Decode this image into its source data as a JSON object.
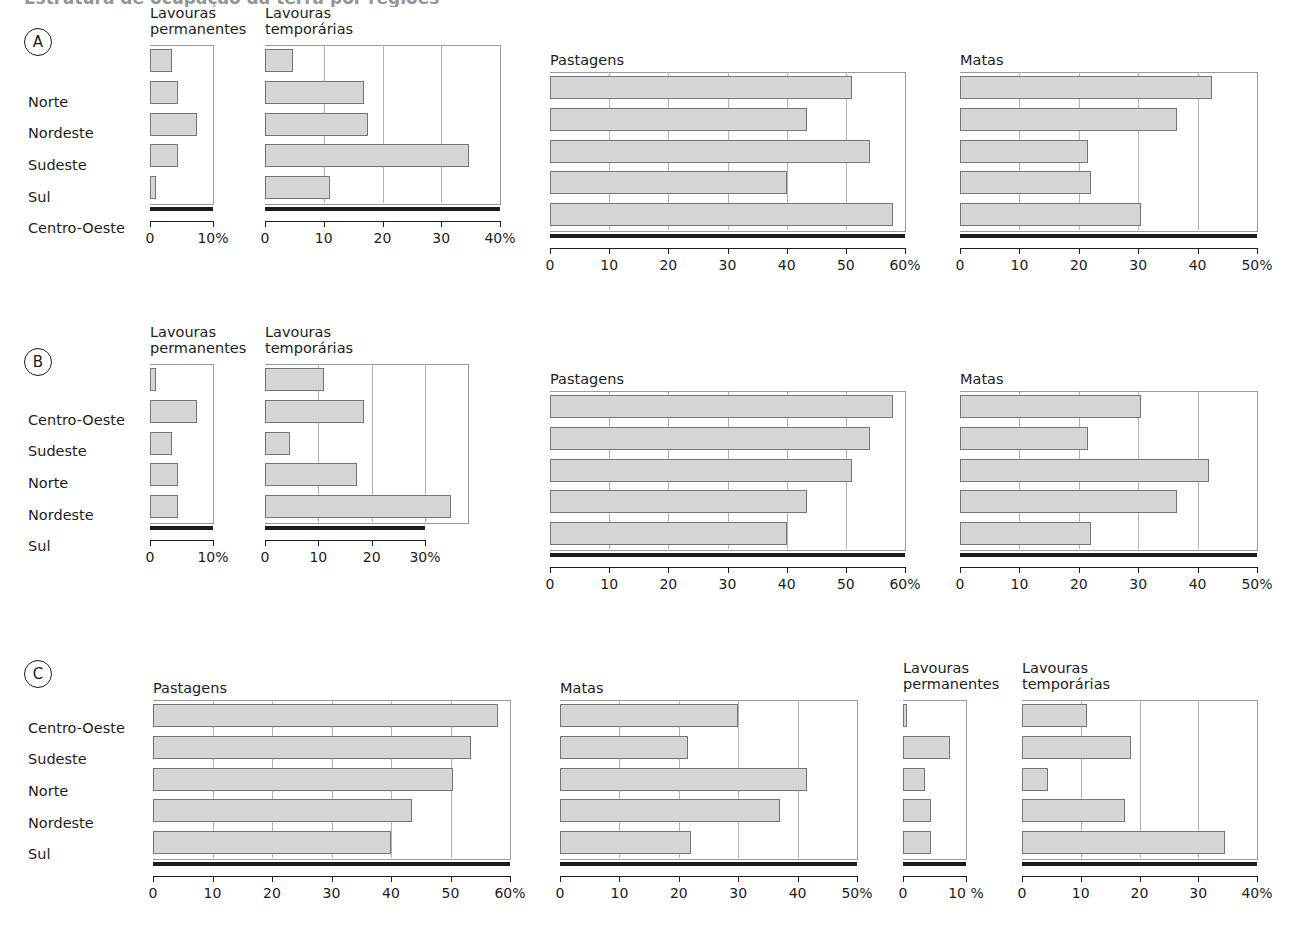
{
  "figure": {
    "cut_title": "Estrutura de ocupação da terra por regiões",
    "group_labels": [
      "A",
      "B",
      "C"
    ],
    "chart_titles": {
      "permanentes": "Lavouras\npermanentes",
      "temporarias": "Lavouras\ntemporárias",
      "pastagens": "Pastagens",
      "matas": "Matas"
    },
    "colors": {
      "bar_fill": "#d6d6d6",
      "bar_stroke": "#757575",
      "axis": "#1c1c1c",
      "grid": "#b4b4b4",
      "frame": "#9a9a9a"
    }
  },
  "chart_data": [
    {
      "id": "A-permanentes",
      "panel": "A",
      "type": "bar",
      "orientation": "horizontal",
      "title": "Lavouras permanentes",
      "categories": [
        "Norte",
        "Nordeste",
        "Sudeste",
        "Sul",
        "Centro-Oeste"
      ],
      "values": [
        3.5,
        4.5,
        7.5,
        4.5,
        1.0
      ],
      "xlabel": "",
      "ylabel": "",
      "xlim": [
        0,
        10
      ],
      "ticks": [
        0,
        10
      ],
      "ticklabels": [
        "0",
        "10%"
      ],
      "grid": false
    },
    {
      "id": "A-temporarias",
      "panel": "A",
      "type": "bar",
      "orientation": "horizontal",
      "title": "Lavouras temporárias",
      "categories": [
        "Norte",
        "Nordeste",
        "Sudeste",
        "Sul",
        "Centro-Oeste"
      ],
      "values": [
        4.7,
        16.8,
        17.6,
        34.8,
        11.0
      ],
      "xlim": [
        0,
        40
      ],
      "ticks": [
        0,
        10,
        20,
        30,
        40
      ],
      "ticklabels": [
        "0",
        "10",
        "20",
        "30",
        "40%"
      ],
      "grid": true
    },
    {
      "id": "A-pastagens",
      "panel": "A",
      "type": "bar",
      "orientation": "horizontal",
      "title": "Pastagens",
      "categories": [
        "Norte",
        "Nordeste",
        "Sudeste",
        "Sul",
        "Centro-Oeste"
      ],
      "values": [
        51.0,
        43.5,
        54.0,
        40.0,
        58.0
      ],
      "xlim": [
        0,
        60
      ],
      "ticks": [
        0,
        10,
        20,
        30,
        40,
        50,
        60
      ],
      "ticklabels": [
        "0",
        "10",
        "20",
        "30",
        "40",
        "50",
        "60%"
      ],
      "grid": true
    },
    {
      "id": "A-matas",
      "panel": "A",
      "type": "bar",
      "orientation": "horizontal",
      "title": "Matas",
      "categories": [
        "Norte",
        "Nordeste",
        "Sudeste",
        "Sul",
        "Centro-Oeste"
      ],
      "values": [
        42.5,
        36.5,
        21.5,
        22.0,
        30.5
      ],
      "xlim": [
        0,
        50
      ],
      "ticks": [
        0,
        10,
        20,
        30,
        40,
        50
      ],
      "ticklabels": [
        "0",
        "10",
        "20",
        "30",
        "40",
        "50%"
      ],
      "grid": true
    },
    {
      "id": "B-permanentes",
      "panel": "B",
      "type": "bar",
      "orientation": "horizontal",
      "title": "Lavouras permanentes",
      "categories": [
        "Centro-Oeste",
        "Sudeste",
        "Norte",
        "Nordeste",
        "Sul"
      ],
      "values": [
        1.0,
        7.5,
        3.5,
        4.5,
        4.5
      ],
      "xlim": [
        0,
        10
      ],
      "ticks": [
        0,
        10
      ],
      "ticklabels": [
        "0",
        "10%"
      ],
      "grid": false
    },
    {
      "id": "B-temporarias",
      "panel": "B",
      "type": "bar",
      "orientation": "horizontal",
      "title": "Lavouras temporárias",
      "categories": [
        "Centro-Oeste",
        "Sudeste",
        "Norte",
        "Nordeste",
        "Sul"
      ],
      "values": [
        11.0,
        18.5,
        4.7,
        17.2,
        34.8
      ],
      "xlim": [
        0,
        38
      ],
      "ticks": [
        0,
        10,
        20,
        30
      ],
      "ticklabels": [
        "0",
        "10",
        "20",
        "30%"
      ],
      "grid": true
    },
    {
      "id": "B-pastagens",
      "panel": "B",
      "type": "bar",
      "orientation": "horizontal",
      "title": "Pastagens",
      "categories": [
        "Centro-Oeste",
        "Sudeste",
        "Norte",
        "Nordeste",
        "Sul"
      ],
      "values": [
        58.0,
        54.0,
        51.0,
        43.5,
        40.0
      ],
      "xlim": [
        0,
        60
      ],
      "ticks": [
        0,
        10,
        20,
        30,
        40,
        50,
        60
      ],
      "ticklabels": [
        "0",
        "10",
        "20",
        "30",
        "40",
        "50",
        "60%"
      ],
      "grid": true
    },
    {
      "id": "B-matas",
      "panel": "B",
      "type": "bar",
      "orientation": "horizontal",
      "title": "Matas",
      "categories": [
        "Centro-Oeste",
        "Sudeste",
        "Norte",
        "Nordeste",
        "Sul"
      ],
      "values": [
        30.5,
        21.5,
        42.0,
        36.5,
        22.0
      ],
      "xlim": [
        0,
        50
      ],
      "ticks": [
        0,
        10,
        20,
        30,
        40,
        50
      ],
      "ticklabels": [
        "0",
        "10",
        "20",
        "30",
        "40",
        "50%"
      ],
      "grid": true
    },
    {
      "id": "C-pastagens",
      "panel": "C",
      "type": "bar",
      "orientation": "horizontal",
      "title": "Pastagens",
      "categories": [
        "Centro-Oeste",
        "Sudeste",
        "Norte",
        "Nordeste",
        "Sul"
      ],
      "values": [
        58.0,
        53.5,
        50.5,
        43.5,
        40.0
      ],
      "xlim": [
        0,
        60
      ],
      "ticks": [
        0,
        10,
        20,
        30,
        40,
        50,
        60
      ],
      "ticklabels": [
        "0",
        "10",
        "20",
        "30",
        "40",
        "50",
        "60%"
      ],
      "grid": true
    },
    {
      "id": "C-matas",
      "panel": "C",
      "type": "bar",
      "orientation": "horizontal",
      "title": "Matas",
      "categories": [
        "Centro-Oeste",
        "Sudeste",
        "Norte",
        "Nordeste",
        "Sul"
      ],
      "values": [
        30.0,
        21.5,
        41.5,
        37.0,
        22.0
      ],
      "xlim": [
        0,
        50
      ],
      "ticks": [
        0,
        10,
        20,
        30,
        40,
        50
      ],
      "ticklabels": [
        "0",
        "10",
        "20",
        "30",
        "40",
        "50%"
      ],
      "grid": true
    },
    {
      "id": "C-permanentes",
      "panel": "C",
      "type": "bar",
      "orientation": "horizontal",
      "title": "Lavouras permanentes",
      "categories": [
        "Centro-Oeste",
        "Sudeste",
        "Norte",
        "Nordeste",
        "Sul"
      ],
      "values": [
        0.6,
        7.5,
        3.5,
        4.5,
        4.5
      ],
      "xlim": [
        0,
        10
      ],
      "ticks": [
        0,
        10
      ],
      "ticklabels": [
        "0",
        "10 %"
      ],
      "grid": false
    },
    {
      "id": "C-temporarias",
      "panel": "C",
      "type": "bar",
      "orientation": "horizontal",
      "title": "Lavouras temporárias",
      "categories": [
        "Centro-Oeste",
        "Sudeste",
        "Norte",
        "Nordeste",
        "Sul"
      ],
      "values": [
        11.0,
        18.5,
        4.5,
        17.5,
        34.5
      ],
      "xlim": [
        0,
        40
      ],
      "ticks": [
        0,
        10,
        20,
        30,
        40
      ],
      "ticklabels": [
        "0",
        "10",
        "20",
        "30",
        "40%"
      ],
      "grid": true
    }
  ],
  "layout": {
    "panels": [
      {
        "group": "A",
        "badge_x": 24,
        "badge_y": 28,
        "labels_x": 28,
        "labels_y": 86,
        "charts": [
          {
            "id": "A-permanentes",
            "x": 150,
            "y": 45,
            "w": 63,
            "h": 158,
            "title_y": -40,
            "two_line": true,
            "axis_w": 63
          },
          {
            "id": "A-temporarias",
            "x": 265,
            "y": 45,
            "w": 235,
            "h": 158,
            "title_y": -40,
            "two_line": true,
            "axis_w": 235
          },
          {
            "id": "A-pastagens",
            "x": 550,
            "y": 72,
            "w": 355,
            "h": 158,
            "title_y": -20,
            "two_line": false,
            "axis_w": 355
          },
          {
            "id": "A-matas",
            "x": 960,
            "y": 72,
            "w": 297,
            "h": 158,
            "title_y": -20,
            "two_line": false,
            "axis_w": 297
          }
        ]
      },
      {
        "group": "B",
        "badge_x": 24,
        "badge_y": 348,
        "labels_x": 28,
        "labels_y": 404,
        "charts": [
          {
            "id": "B-permanentes",
            "x": 150,
            "y": 364,
            "w": 63,
            "h": 158,
            "title_y": -40,
            "two_line": true,
            "axis_w": 63
          },
          {
            "id": "B-temporarias",
            "x": 265,
            "y": 364,
            "w": 203,
            "h": 158,
            "title_y": -40,
            "two_line": true,
            "axis_w": 160
          },
          {
            "id": "B-pastagens",
            "x": 550,
            "y": 391,
            "w": 355,
            "h": 158,
            "title_y": -20,
            "two_line": false,
            "axis_w": 355
          },
          {
            "id": "B-matas",
            "x": 960,
            "y": 391,
            "w": 297,
            "h": 158,
            "title_y": -20,
            "two_line": false,
            "axis_w": 297
          }
        ]
      },
      {
        "group": "C",
        "badge_x": 24,
        "badge_y": 660,
        "labels_x": 28,
        "labels_y": 712,
        "charts": [
          {
            "id": "C-pastagens",
            "x": 153,
            "y": 700,
            "w": 357,
            "h": 158,
            "title_y": -20,
            "two_line": false,
            "axis_w": 357
          },
          {
            "id": "C-matas",
            "x": 560,
            "y": 700,
            "w": 297,
            "h": 158,
            "title_y": -20,
            "two_line": false,
            "axis_w": 297
          },
          {
            "id": "C-permanentes",
            "x": 903,
            "y": 700,
            "w": 63,
            "h": 158,
            "title_y": -40,
            "two_line": true,
            "axis_w": 63
          },
          {
            "id": "C-temporarias",
            "x": 1022,
            "y": 700,
            "w": 235,
            "h": 158,
            "title_y": -40,
            "two_line": true,
            "axis_w": 235
          }
        ]
      }
    ]
  }
}
